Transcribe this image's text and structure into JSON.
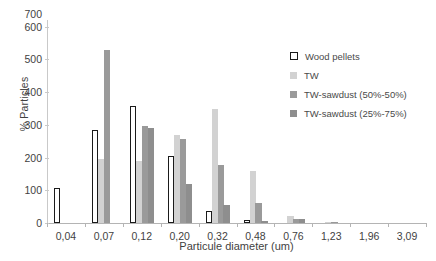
{
  "chart_data": {
    "type": "bar",
    "title": "",
    "xlabel": "Particule diameter (um)",
    "ylabel": "% Particles",
    "ylim": [
      0,
      620
    ],
    "yticks": [
      0,
      100,
      200,
      300,
      400,
      500,
      600,
      700
    ],
    "ytick_labels": [
      "0",
      "100",
      "200",
      "300",
      "400",
      "500",
      "600",
      "700"
    ],
    "grid": false,
    "legend_position": "top-right",
    "categories": [
      "0,04",
      "0,07",
      "0,12",
      "0,20",
      "0,32",
      "0,48",
      "0,76",
      "1,23",
      "1,96",
      "3,09"
    ],
    "series": [
      {
        "name": "Wood pellets",
        "color": "#ffffff",
        "edge_color": "#1a1a1a",
        "values": [
          108,
          285,
          358,
          205,
          38,
          8,
          0,
          0,
          0,
          0
        ]
      },
      {
        "name": "TW",
        "color": "#d2d2d2",
        "values": [
          0,
          195,
          190,
          268,
          348,
          158,
          20,
          2,
          0,
          0
        ]
      },
      {
        "name": "TW-sawdust (50%-50%)",
        "color": "#9a9a9a",
        "values": [
          0,
          527,
          295,
          258,
          178,
          62,
          12,
          2,
          0,
          0
        ]
      },
      {
        "name": "TW-sawdust (25%-75%)",
        "color": "#8e8e8e",
        "values": [
          0,
          0,
          290,
          120,
          55,
          5,
          12,
          0,
          0,
          0
        ]
      }
    ]
  },
  "legend": {
    "items": [
      {
        "label": "Wood pellets"
      },
      {
        "label": "TW"
      },
      {
        "label": "TW-sawdust (50%-50%)"
      },
      {
        "label": "TW-sawdust (25%-75%)"
      }
    ]
  }
}
